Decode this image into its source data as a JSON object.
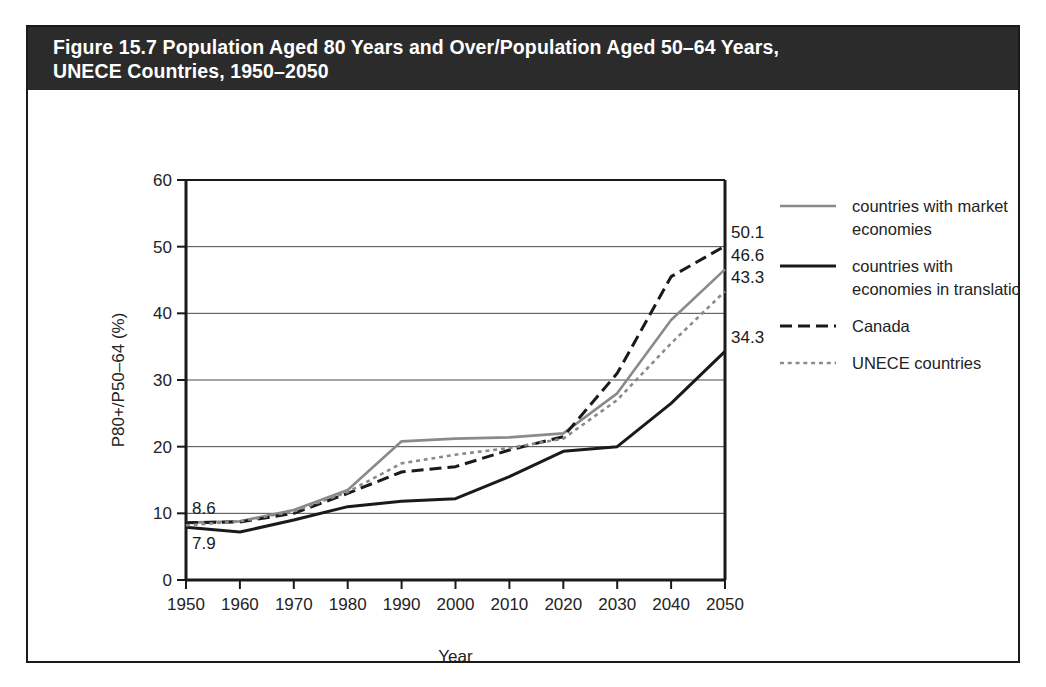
{
  "figure": {
    "title": "Figure 15.7 Population Aged 80 Years and Over/Population Aged 50–64 Years,\nUNECE Countries, 1950–2050",
    "border_color": "#1a1a1a",
    "title_bar_color": "#2b2b2b",
    "title_text_color": "#ffffff"
  },
  "chart_data": {
    "type": "line",
    "title": "Figure 15.7 Population Aged 80 Years and Over/Population Aged 50–64 Years, UNECE Countries, 1950–2050",
    "xlabel": "Year",
    "ylabel": "P80+/P50–64 (%)",
    "xlim": [
      1950,
      2050
    ],
    "ylim": [
      0,
      60
    ],
    "xticks": [
      1950,
      1960,
      1970,
      1980,
      1990,
      2000,
      2010,
      2020,
      2030,
      2040,
      2050
    ],
    "yticks": [
      0,
      10,
      20,
      30,
      40,
      50,
      60
    ],
    "grid": "horizontal",
    "legend_position": "right",
    "x": [
      1950,
      1960,
      1970,
      1980,
      1990,
      2000,
      2010,
      2020,
      2030,
      2040,
      2050
    ],
    "series": [
      {
        "name": "countries with market economies",
        "style": "solid",
        "color": "#8a8a8a",
        "width": 2.6,
        "values": [
          8.6,
          8.8,
          10.5,
          13.5,
          20.8,
          21.2,
          21.4,
          22.0,
          28.0,
          39.0,
          46.6
        ]
      },
      {
        "name": "countries with economies in translation",
        "style": "solid",
        "color": "#1a1a1a",
        "width": 3.0,
        "values": [
          7.9,
          7.2,
          9.0,
          11.0,
          11.8,
          12.2,
          15.5,
          19.3,
          20.0,
          26.5,
          34.3
        ]
      },
      {
        "name": "Canada",
        "style": "dashed",
        "color": "#1a1a1a",
        "width": 3.0,
        "values": [
          8.6,
          8.7,
          10.0,
          13.0,
          16.2,
          17.0,
          19.5,
          21.5,
          31.0,
          45.5,
          50.1
        ]
      },
      {
        "name": "UNECE countries",
        "style": "dotted",
        "color": "#8a8a8a",
        "width": 2.6,
        "values": [
          8.2,
          8.8,
          10.3,
          13.2,
          17.5,
          18.8,
          19.8,
          21.2,
          27.0,
          35.5,
          43.3
        ]
      }
    ],
    "annotations": [
      {
        "text": "8.6",
        "x": 1950,
        "y": 8.6,
        "anchor": "start-above"
      },
      {
        "text": "7.9",
        "x": 1950,
        "y": 7.9,
        "anchor": "start-below"
      },
      {
        "text": "50.1",
        "x": 2050,
        "y": 50.1,
        "anchor": "end-above"
      },
      {
        "text": "46.6",
        "x": 2050,
        "y": 46.6,
        "anchor": "end-above"
      },
      {
        "text": "43.3",
        "x": 2050,
        "y": 43.3,
        "anchor": "end-above"
      },
      {
        "text": "34.3",
        "x": 2050,
        "y": 34.3,
        "anchor": "end-above"
      }
    ]
  },
  "legend": {
    "items": [
      {
        "label": "countries with market\neconomies",
        "style": "solid",
        "color": "#8a8a8a",
        "width": 2.6
      },
      {
        "label": "countries with\neconomies in translation",
        "style": "solid",
        "color": "#1a1a1a",
        "width": 3.2
      },
      {
        "label": "Canada",
        "style": "dashed",
        "color": "#1a1a1a",
        "width": 3.0
      },
      {
        "label": "UNECE countries",
        "style": "dotted",
        "color": "#8a8a8a",
        "width": 2.6
      }
    ]
  }
}
